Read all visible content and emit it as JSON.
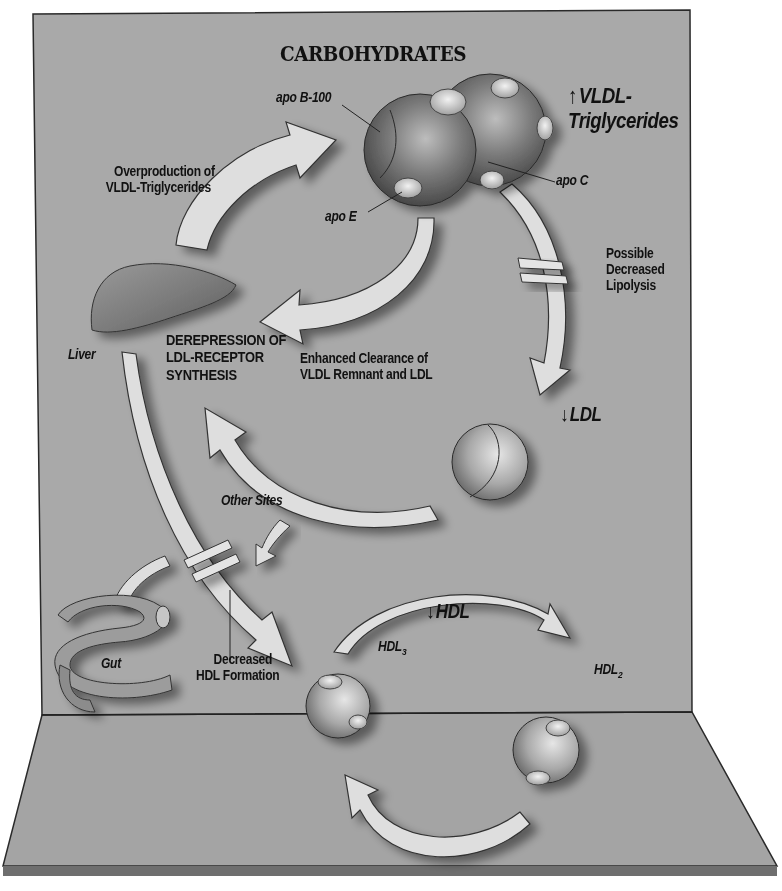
{
  "title": "CARBOHYDRATES",
  "labels": {
    "vldl_tg_arrow": "↑",
    "vldl_tg_line1": "VLDL-",
    "vldl_tg_line2": "Triglycerides",
    "apo_b100": "apo B-100",
    "apo_c": "apo C",
    "apo_e": "apo E",
    "overproduction_line1": "Overproduction of",
    "overproduction_line2": "VLDL-Triglycerides",
    "possible_line1": "Possible",
    "possible_line2": "Decreased",
    "possible_line3": "Lipolysis",
    "liver": "Liver",
    "derepression_line1": "DEREPRESSION OF",
    "derepression_line2": "LDL-RECEPTOR",
    "derepression_line3": "SYNTHESIS",
    "enhanced_line1": "Enhanced Clearance of",
    "enhanced_line2": "VLDL Remnant and LDL",
    "ldl_arrow": "↓",
    "ldl": "LDL",
    "other_sites": "Other Sites",
    "hdl_arrow": "↓",
    "hdl": "HDL",
    "hdl3_base": "HDL",
    "hdl3_sub": "3",
    "hdl2_base": "HDL",
    "hdl2_sub": "2",
    "gut": "Gut",
    "decreased_hdl_line1": "Decreased",
    "decreased_hdl_line2": "HDL Formation"
  },
  "colors": {
    "backdrop": "#a9a9a9",
    "floor": "#a4a4a4",
    "arrow_fill": "#dedede",
    "sphere_dark": "#5f5f5f",
    "text": "#111111"
  }
}
